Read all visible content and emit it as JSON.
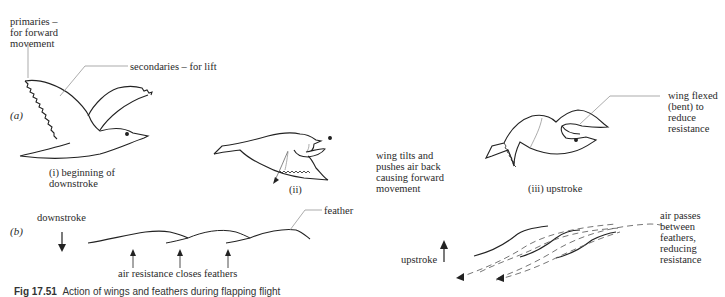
{
  "figure": {
    "parts": {
      "a": "(a)",
      "b": "(b)"
    },
    "panel_a": {
      "primaries_label": "primaries –\nfor forward\nmovement",
      "secondaries_label": "secondaries – for lift",
      "stage_i_label": "(i) beginning of\n     downstroke",
      "stage_ii_label": "(ii)",
      "stage_iii_label": "(iii)  upstroke",
      "wing_tilts_label": "wing tilts and\npushes air back\ncausing forward\nmovement",
      "wing_flexed_label": "wing flexed\n(bent) to\nreduce\nresistance"
    },
    "panel_b": {
      "downstroke_label": "downstroke",
      "feather_label": "feather",
      "air_resistance_label": "air resistance closes feathers",
      "upstroke_label": "upstroke",
      "air_passes_label": "air passes\nbetween\nfeathers,\nreducing\nresistance"
    },
    "caption": {
      "number": "Fig 17.51",
      "text": "Action of wings and feathers during flapping flight"
    },
    "icons": [
      "bird-downstroke-drawing",
      "bird-midstroke-drawing",
      "bird-upstroke-drawing",
      "arrow-down-icon",
      "arrow-up-icon",
      "dashed-airflow-arrow-icon"
    ],
    "colors": {
      "line": "#222222",
      "leader": "#888888",
      "background": "#ffffff"
    }
  }
}
